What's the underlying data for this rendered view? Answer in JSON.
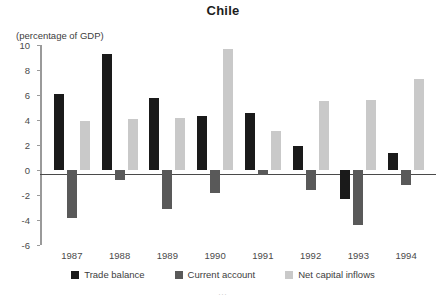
{
  "chart_data": {
    "type": "bar",
    "title": "Chile",
    "subtitle": "(percentage of GDP)",
    "xlabel": "",
    "ylabel": "(percentage of GDP)",
    "ylim": [
      -6,
      10
    ],
    "yticks": [
      10,
      8,
      6,
      4,
      2,
      0,
      -2,
      -4,
      -6
    ],
    "ytick_labels": [
      "10",
      "8",
      "6",
      "4",
      "2",
      "0",
      "-2",
      "-4",
      "-6"
    ],
    "grid": false,
    "legend_position": "bottom",
    "categories": [
      "1987",
      "1988",
      "1989",
      "1990",
      "1991",
      "1992",
      "1993",
      "1994"
    ],
    "series": [
      {
        "name": "Trade balance",
        "color": "#1a1a1a",
        "values": [
          6.1,
          9.3,
          5.8,
          4.3,
          4.6,
          1.9,
          -2.3,
          1.4
        ]
      },
      {
        "name": "Current account",
        "color": "#595959",
        "values": [
          -3.8,
          -0.8,
          -3.1,
          -1.8,
          -0.4,
          -1.6,
          -4.4,
          -1.2
        ]
      },
      {
        "name": "Net capital inflows",
        "color": "#c9c9c9",
        "values": [
          3.9,
          4.1,
          4.2,
          9.7,
          3.1,
          5.5,
          5.6,
          7.3
        ]
      }
    ]
  },
  "footer": {
    "note": "..."
  }
}
